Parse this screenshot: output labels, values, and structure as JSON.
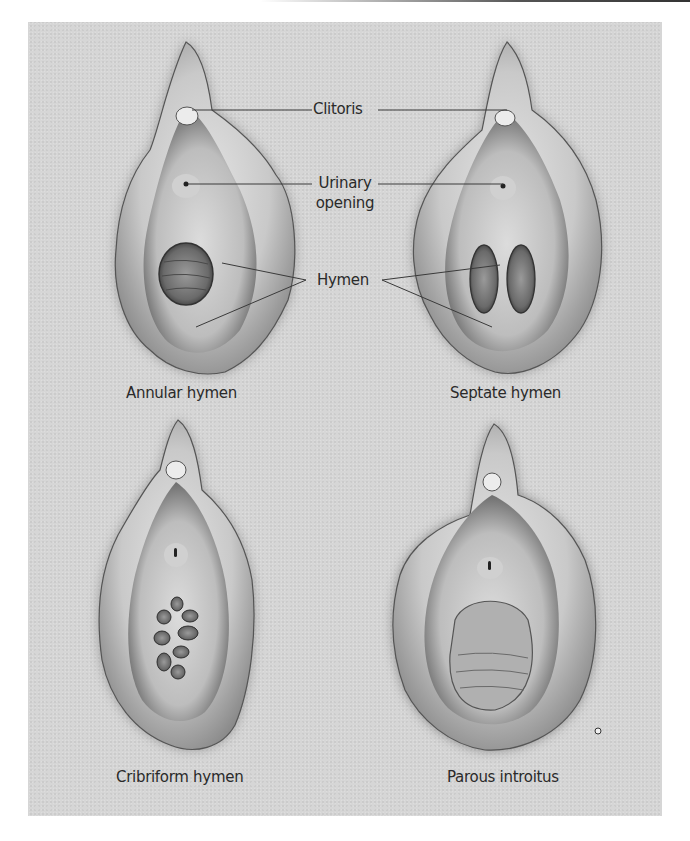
{
  "figure": {
    "callouts": {
      "clitoris": "Clitoris",
      "urinary_opening_line1": "Urinary",
      "urinary_opening_line2": "opening",
      "hymen": "Hymen"
    },
    "panels": [
      {
        "id": "annular",
        "caption": "Annular hymen"
      },
      {
        "id": "septate",
        "caption": "Septate hymen"
      },
      {
        "id": "cribriform",
        "caption": "Cribriform hymen"
      },
      {
        "id": "parous",
        "caption": "Parous introitus"
      }
    ],
    "colors": {
      "background": "#d6d6d6",
      "text": "#2a2a2a",
      "leader_line": "#3a3a3a"
    }
  }
}
